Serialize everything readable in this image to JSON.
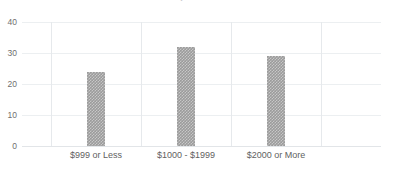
{
  "chart_data": {
    "type": "bar",
    "title": "Amount Spent on Purchase",
    "xlabel": "",
    "ylabel": "",
    "categories": [
      "$999 or Less",
      "$1000 - $1999",
      "$2000 or More"
    ],
    "values": [
      24,
      32,
      29
    ],
    "ylim": [
      0,
      40
    ],
    "yticks": [
      0,
      10,
      20,
      30,
      40
    ],
    "ytick_labels": [
      "0",
      "10",
      "20",
      "30",
      "40"
    ],
    "grid": true,
    "legend": false,
    "legend_position": "none",
    "bar_color": "#9b9b9b",
    "gridline_color": "#eceff1",
    "axis_text_color": "#5f5f5f",
    "background_color": "#ffffff"
  },
  "axes": {
    "y_ticks": [
      {
        "label": "40",
        "value": 40
      },
      {
        "label": "30",
        "value": 30
      },
      {
        "label": "20",
        "value": 20
      },
      {
        "label": "10",
        "value": 10
      },
      {
        "label": "0",
        "value": 0
      }
    ],
    "x_ticks": [
      {
        "label": "$999 or Less"
      },
      {
        "label": "$1000 - $1999"
      },
      {
        "label": "$2000 or More"
      }
    ]
  },
  "bars": [
    {
      "label": "$999 or Less",
      "value": 24
    },
    {
      "label": "$1000 - $1999",
      "value": 32
    },
    {
      "label": "$2000 or More",
      "value": 29
    }
  ]
}
